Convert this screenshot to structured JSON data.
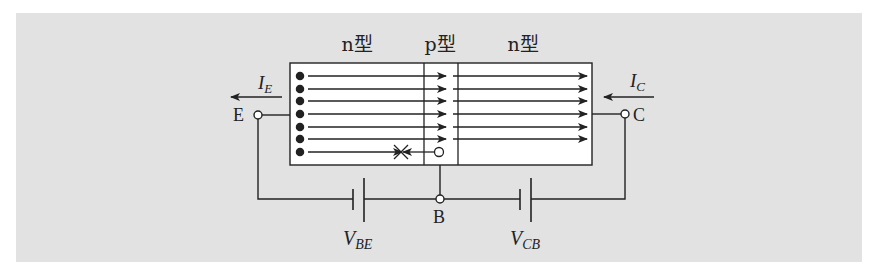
{
  "figure": {
    "regions": [
      {
        "label": "n型",
        "role": "emitter"
      },
      {
        "label": "p型",
        "role": "base"
      },
      {
        "label": "n型",
        "role": "collector"
      }
    ],
    "terminals": {
      "emitter": "E",
      "base": "B",
      "collector": "C"
    },
    "currents": {
      "emitter": {
        "symbol": "I",
        "subscript": "E"
      },
      "collector": {
        "symbol": "I",
        "subscript": "C"
      }
    },
    "voltages": {
      "base_emitter": {
        "symbol": "V",
        "subscript": "BE"
      },
      "collector_base": {
        "symbol": "V",
        "subscript": "CB"
      }
    },
    "carriers": {
      "electron_rows": 7,
      "electrons_crossing_to_collector": 6,
      "recombination_rows": 1
    },
    "colors": {
      "background": "#e2e2e2",
      "device_fill": "#ffffff",
      "stroke": "#222222"
    }
  }
}
